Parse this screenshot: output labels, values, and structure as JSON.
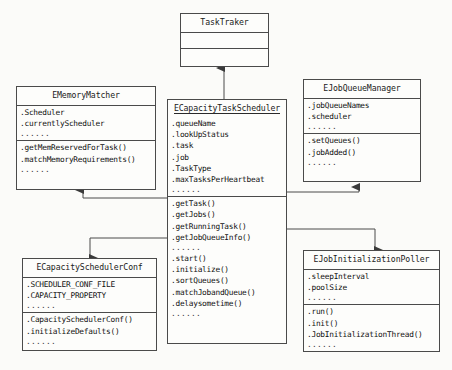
{
  "diagram": {
    "line_color": "#4a4a4a",
    "background": "#fbfbf9",
    "ellipsis": "......"
  },
  "classes": [
    {
      "id": "task-traker",
      "name": "TaskTraker",
      "underlined": false,
      "attributes": [],
      "methods": [],
      "attributes_ellipsis": false,
      "methods_ellipsis": false,
      "empty_compartments": true
    },
    {
      "id": "ememory-matcher",
      "name": "EMemoryMatcher",
      "underlined": false,
      "attributes": [
        ".Scheduler",
        ".currentlyScheduler"
      ],
      "methods": [
        ".getMemReservedForTask()",
        ".matchMemoryRequirements()"
      ],
      "attributes_ellipsis": true,
      "methods_ellipsis": true,
      "empty_compartments": false
    },
    {
      "id": "ecapacity-task-scheduler",
      "name": "ECapacityTaskScheduler",
      "underlined": true,
      "attributes": [
        ".queueName",
        ".lookUpStatus",
        ".task",
        ".job",
        ".TaskType",
        ".maxTasksPerHeartbeat"
      ],
      "methods": [
        ".getTask()",
        ".getJobs()",
        ".getRunningTask()",
        ".getJobQueueInfo()"
      ],
      "methods2": [
        ".start()",
        ".initialize()",
        ".sortQueues()",
        ".matchJobandQueue()",
        ".delaysometime()"
      ],
      "attributes_ellipsis": true,
      "methods_ellipsis": true,
      "methods2_ellipsis": true,
      "empty_compartments": false
    },
    {
      "id": "ejob-queue-manager",
      "name": "EJobQueueManager",
      "underlined": false,
      "attributes": [
        ".jobQueueNames",
        ".scheduler"
      ],
      "methods": [
        ".setQueues()",
        ".jobAdded()"
      ],
      "attributes_ellipsis": true,
      "methods_ellipsis": true,
      "empty_compartments": false
    },
    {
      "id": "ecapacity-scheduler-conf",
      "name": "ECapacitySchedulerConf",
      "underlined": false,
      "attributes": [
        ".SCHEDULER_CONF_FILE",
        ".CAPACITY_PROPERTY"
      ],
      "methods": [
        ".CapacitySchedulerConf()",
        ".initializeDefaults()"
      ],
      "attributes_ellipsis": true,
      "methods_ellipsis": true,
      "empty_compartments": false
    },
    {
      "id": "ejob-initialization-poller",
      "name": "EJobInitializationPoller",
      "underlined": false,
      "attributes": [
        ".sleepInterval",
        ".poolSize"
      ],
      "methods": [
        ".run()",
        ".init()",
        ".JobInitializationThread()"
      ],
      "attributes_ellipsis": true,
      "methods_ellipsis": true,
      "empty_compartments": false
    }
  ],
  "relations": [
    {
      "from": "ecapacity-task-scheduler",
      "to": "task-traker",
      "kind": "association-arrow-up"
    },
    {
      "from": "ecapacity-task-scheduler",
      "to": "ememory-matcher",
      "kind": "association-arrow-up"
    },
    {
      "from": "ecapacity-task-scheduler",
      "to": "ejob-queue-manager",
      "kind": "association-arrow-up"
    },
    {
      "from": "ecapacity-task-scheduler",
      "to": "ecapacity-scheduler-conf",
      "kind": "association-arrow-down"
    },
    {
      "from": "ecapacity-task-scheduler",
      "to": "ejob-initialization-poller",
      "kind": "association-arrow-down"
    }
  ]
}
